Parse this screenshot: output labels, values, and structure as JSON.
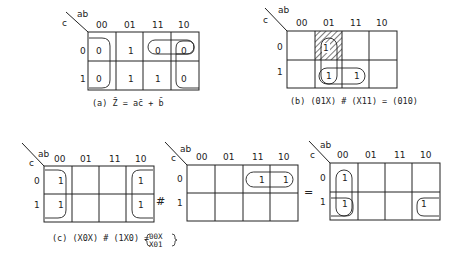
{
  "figure": {
    "col_header_var": "ab",
    "row_header_var": "c",
    "columns": [
      "00",
      "01",
      "11",
      "10"
    ],
    "rows": [
      "0",
      "1"
    ]
  },
  "panels": {
    "a": {
      "caption": "(a) Z̄ = ac̄ + b̄",
      "cells": [
        [
          "0",
          "1",
          "0",
          "0"
        ],
        [
          "0",
          "1",
          "1",
          "0"
        ]
      ]
    },
    "b": {
      "caption": "(b) (01X) # (X11) = (010)",
      "cells": [
        [
          "",
          "1",
          "",
          ""
        ],
        [
          "",
          "1",
          "1",
          ""
        ]
      ],
      "hatched_cell": "c=0, ab=01"
    },
    "c": {
      "caption_left": "(c) (X0X) # (1X0) =",
      "result_top": "00X",
      "result_bottom": "X01",
      "operator_sharp": "#",
      "operator_equals": "=",
      "map1_cells": [
        [
          "1",
          "",
          "",
          "1"
        ],
        [
          "1",
          "",
          "",
          "1"
        ]
      ],
      "map2_cells": [
        [
          "",
          "",
          "1",
          "1"
        ],
        [
          "",
          "",
          "",
          ""
        ]
      ],
      "map3_cells": [
        [
          "1",
          "",
          "",
          ""
        ],
        [
          "1",
          "",
          "",
          "1"
        ]
      ]
    }
  }
}
